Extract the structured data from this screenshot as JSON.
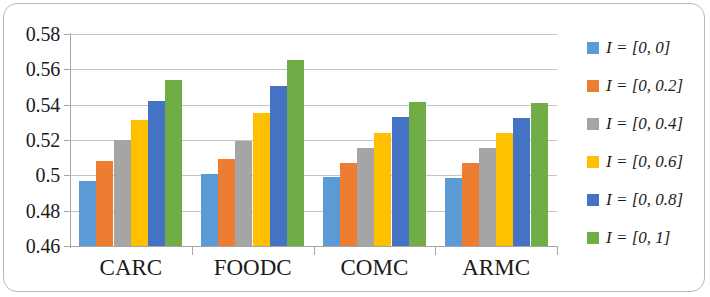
{
  "chart_data": {
    "type": "bar",
    "title": "",
    "xlabel": "",
    "ylabel": "",
    "categories": [
      "CARC",
      "FOODC",
      "COMC",
      "ARMC"
    ],
    "ylim": [
      0.46,
      0.58
    ],
    "yticks": [
      0.46,
      0.48,
      0.5,
      0.52,
      0.54,
      0.56,
      0.58
    ],
    "ytick_labels": [
      "0.46",
      "0.48",
      "0.5",
      "0.52",
      "0.54",
      "0.56",
      "0.58"
    ],
    "grid": true,
    "legend_position": "right",
    "series": [
      {
        "name": "I = [0, 0]",
        "color": "#5B9BD5",
        "values": [
          0.497,
          0.5005,
          0.4988,
          0.4987
        ]
      },
      {
        "name": "I = [0, 0.2]",
        "color": "#ED7D31",
        "values": [
          0.508,
          0.5095,
          0.5072,
          0.5068
        ]
      },
      {
        "name": "I = [0, 0.4]",
        "color": "#A5A5A5",
        "values": [
          0.5198,
          0.5197,
          0.5157,
          0.5155
        ]
      },
      {
        "name": "I = [0, 0.6]",
        "color": "#FFC000",
        "values": [
          0.5312,
          0.5352,
          0.5238,
          0.5237
        ]
      },
      {
        "name": "I = [0, 0.8]",
        "color": "#4472C4",
        "values": [
          0.5423,
          0.5503,
          0.5328,
          0.5325
        ]
      },
      {
        "name": "I = [0, 1]",
        "color": "#70AD47",
        "values": [
          0.5538,
          0.5652,
          0.5415,
          0.5412
        ]
      }
    ]
  }
}
